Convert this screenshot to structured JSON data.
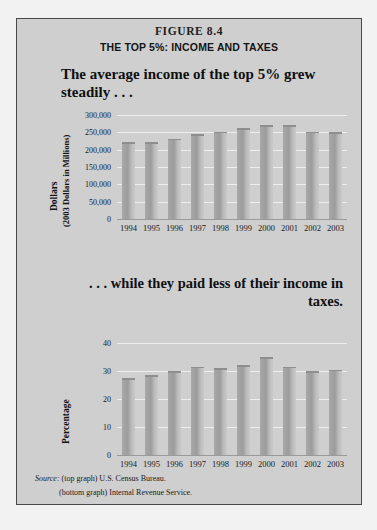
{
  "figure": {
    "label": "FIGURE 8.4",
    "subtitle": "THE TOP 5%: INCOME AND TAXES",
    "headline_top": "The average income of the top 5% grew steadily . . .",
    "headline_bottom": ". . . while they paid less of their income in taxes.",
    "source_prefix": "Source:",
    "source_top": "(top graph) U.S. Census Bureau.",
    "source_bottom": "(bottom graph) Internal Revenue Service."
  },
  "colors": {
    "panel_background": "#cfcfcf",
    "page_background": "#f2f2f2",
    "border": "#4a4a4a",
    "bar_fill": "#a8a8a8",
    "gridline": "#eeeeee",
    "text": "#111111"
  },
  "chart_data": [
    {
      "type": "bar",
      "id": "top-graph",
      "title": "The average income of the top 5% grew steadily . . .",
      "xlabel": "",
      "ylabel": "Dollars (2003 Dollars in Millions)",
      "ylabel_line1": "Dollars",
      "ylabel_line2": "(2003 Dollars in Millions)",
      "categories": [
        "1994",
        "1995",
        "1996",
        "1997",
        "1998",
        "1999",
        "2000",
        "2001",
        "2002",
        "2003"
      ],
      "values": [
        222000,
        222000,
        232000,
        245000,
        252000,
        262000,
        270000,
        270000,
        252000,
        250000
      ],
      "ylim": [
        0,
        300000
      ],
      "yticks": [
        0,
        50000,
        100000,
        150000,
        200000,
        250000,
        300000
      ],
      "ytick_labels": [
        "0",
        "50,000",
        "100,000",
        "150,000",
        "200,000",
        "250,000",
        "300,000"
      ],
      "grid": true,
      "legend": "none",
      "source": "(top graph) U.S. Census Bureau."
    },
    {
      "type": "bar",
      "id": "bottom-graph",
      "title": ". . . while they paid less of their income in taxes.",
      "xlabel": "",
      "ylabel": "Percentage",
      "categories": [
        "1994",
        "1995",
        "1996",
        "1997",
        "1998",
        "1999",
        "2000",
        "2001",
        "2002",
        "2003"
      ],
      "values": [
        27.5,
        28.5,
        30.0,
        31.5,
        31.0,
        32.0,
        35.0,
        31.5,
        30.0,
        30.5
      ],
      "ylim": [
        0,
        40
      ],
      "yticks": [
        0,
        10,
        20,
        30,
        40
      ],
      "ytick_labels": [
        "0",
        "10",
        "20",
        "30",
        "40"
      ],
      "grid": true,
      "legend": "none",
      "source": "(bottom graph) Internal Revenue Service."
    }
  ]
}
